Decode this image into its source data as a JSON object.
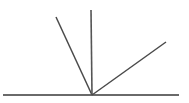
{
  "figure": {
    "name": "angle-rays-figure",
    "type": "line-diagram",
    "width": 189,
    "height": 103,
    "background_color": "#ffffff",
    "vertex": {
      "label": "vertex",
      "x": 92,
      "y": 95
    },
    "baseline": {
      "label": "baseline",
      "x1": 3,
      "y1": 95,
      "x2": 179,
      "y2": 95,
      "color": "#6a6a6a",
      "stroke_width": 1.8
    },
    "rays": [
      {
        "label": "left-diagonal-ray",
        "x1": 92,
        "y1": 95,
        "x2": 56,
        "y2": 17,
        "color": "#4a4a4a",
        "stroke_width": 1.5
      },
      {
        "label": "vertical-ray",
        "x1": 92,
        "y1": 95,
        "x2": 91,
        "y2": 10,
        "color": "#555555",
        "stroke_width": 1.6
      },
      {
        "label": "right-diagonal-ray",
        "x1": 92,
        "y1": 95,
        "x2": 166,
        "y2": 42,
        "color": "#4a4a4a",
        "stroke_width": 1.5
      }
    ]
  }
}
